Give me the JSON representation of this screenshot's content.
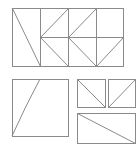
{
  "canvas": {
    "width": 139,
    "height": 147,
    "background": "#ffffff"
  },
  "style": {
    "stroke": "#8a8a8a",
    "stroke_width": 1
  },
  "shapes": {
    "top_grid": {
      "rect": {
        "x": 12,
        "y": 8,
        "w": 111,
        "h": 58
      },
      "lines": [
        {
          "x1": 40,
          "y1": 8,
          "x2": 40,
          "y2": 66
        },
        {
          "x1": 68,
          "y1": 8,
          "x2": 68,
          "y2": 66
        },
        {
          "x1": 96,
          "y1": 8,
          "x2": 96,
          "y2": 66
        },
        {
          "x1": 40,
          "y1": 37,
          "x2": 123,
          "y2": 37
        },
        {
          "x1": 12,
          "y1": 8,
          "x2": 40,
          "y2": 66
        },
        {
          "x1": 68,
          "y1": 8,
          "x2": 40,
          "y2": 37
        },
        {
          "x1": 40,
          "y1": 37,
          "x2": 68,
          "y2": 66
        },
        {
          "x1": 96,
          "y1": 8,
          "x2": 68,
          "y2": 37
        },
        {
          "x1": 68,
          "y1": 37,
          "x2": 96,
          "y2": 66
        },
        {
          "x1": 123,
          "y1": 37,
          "x2": 96,
          "y2": 66
        }
      ]
    },
    "large_square": {
      "rect": {
        "x": 12,
        "y": 79,
        "w": 56,
        "h": 57
      },
      "curve": "M40,79 Q26,105 12,136"
    },
    "small_box_left": {
      "rect": {
        "x": 77,
        "y": 79,
        "w": 28,
        "h": 28
      },
      "diagonal": {
        "x1": 77,
        "y1": 79,
        "x2": 105,
        "y2": 107
      }
    },
    "small_box_right": {
      "rect": {
        "x": 108,
        "y": 79,
        "w": 27,
        "h": 28
      },
      "diagonal": {
        "x1": 135,
        "y1": 79,
        "x2": 108,
        "y2": 107
      }
    },
    "wide_box": {
      "rect": {
        "x": 77,
        "y": 113,
        "w": 58,
        "h": 30
      },
      "diagonal": {
        "x1": 77,
        "y1": 113,
        "x2": 135,
        "y2": 143
      }
    }
  }
}
